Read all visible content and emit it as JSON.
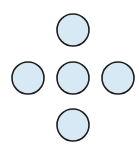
{
  "diagram": {
    "title": "",
    "layout": "plus-cross",
    "style": {
      "fill": "#d6e9f5",
      "stroke": "#1e1e1e",
      "stroke_width": 1.6,
      "background": "#ffffff"
    },
    "nodes": [
      {
        "id": "top",
        "cx": 73,
        "cy": 30,
        "r": 16
      },
      {
        "id": "left",
        "cx": 28,
        "cy": 78,
        "r": 16
      },
      {
        "id": "center",
        "cx": 73,
        "cy": 78,
        "r": 16
      },
      {
        "id": "right",
        "cx": 118,
        "cy": 78,
        "r": 16
      },
      {
        "id": "bottom",
        "cx": 73,
        "cy": 125,
        "r": 16
      }
    ]
  }
}
